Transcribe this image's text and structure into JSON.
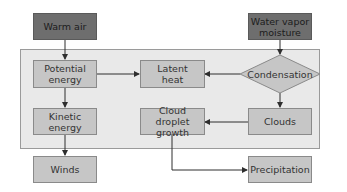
{
  "diagram": {
    "colors": {
      "dark_node": "#6e6e6e",
      "light_node": "#c6c6c6",
      "container": "#e9e9e9",
      "edge": "#2e2e2e"
    },
    "nodes": {
      "warm_air": "Warm air",
      "water_vapor": "Water vapor\nmoisture",
      "potential_energy": "Potential\nenergy",
      "latent_heat": "Latent\nheat",
      "condensation": "Condensation",
      "kinetic_energy": "Kinetic\nenergy",
      "cloud_droplet_growth": "Cloud droplet\ngrowth",
      "clouds": "Clouds",
      "winds": "Winds",
      "precipitation": "Precipitation"
    },
    "edges": [
      {
        "from": "Warm air",
        "to": "Potential energy"
      },
      {
        "from": "Water vapor moisture",
        "to": "Condensation"
      },
      {
        "from": "Potential energy",
        "to": "Latent heat"
      },
      {
        "from": "Condensation",
        "to": "Latent heat"
      },
      {
        "from": "Potential energy",
        "to": "Kinetic energy"
      },
      {
        "from": "Condensation",
        "to": "Clouds"
      },
      {
        "from": "Clouds",
        "to": "Cloud droplet growth"
      },
      {
        "from": "Kinetic energy",
        "to": "Winds"
      },
      {
        "from": "Cloud droplet growth",
        "to": "Precipitation"
      }
    ]
  }
}
